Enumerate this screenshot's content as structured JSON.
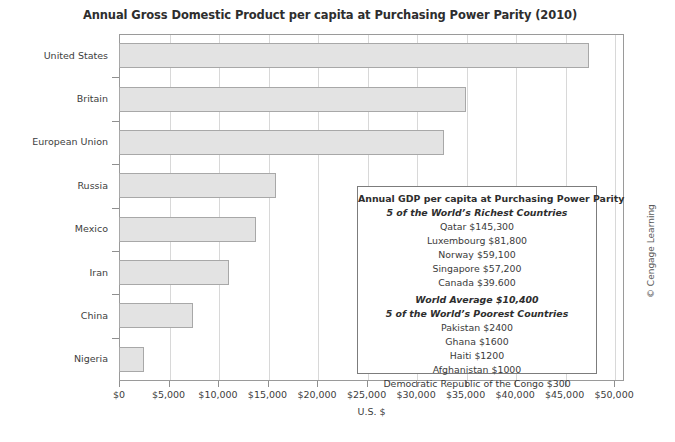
{
  "chart_data": {
    "type": "bar",
    "orientation": "horizontal",
    "title": "Annual Gross Domestic Product per capita at Purchasing Power Parity (2010)",
    "xlabel": "U.S. $",
    "ylabel": "",
    "categories": [
      "United States",
      "Britain",
      "European Union",
      "Russia",
      "Mexico",
      "Iran",
      "China",
      "Nigeria"
    ],
    "values": [
      47500,
      35000,
      32800,
      15900,
      13800,
      11100,
      7500,
      2500
    ],
    "xlim": [
      0,
      51000
    ],
    "xticks": [
      0,
      5000,
      10000,
      15000,
      20000,
      25000,
      30000,
      35000,
      40000,
      45000,
      50000
    ],
    "xticklabels": [
      "$0",
      "$5,000",
      "$10,000",
      "$15,000",
      "$20,000",
      "$25,000",
      "$30,000",
      "$35,000",
      "$40,000",
      "$45,000",
      "$50,000"
    ],
    "grid": "vertical",
    "legend": "none",
    "bar_fill": "#e3e3e3",
    "bar_border": "#a8a8a8",
    "grid_color": "#d8d8d8"
  },
  "infobox": {
    "heading": "Annual GDP per capita at Purchasing Power Parity",
    "richest_heading": "5 of the World’s Richest Countries",
    "richest": [
      "Qatar $145,300",
      "Luxembourg $81,800",
      "Norway $59,100",
      "Singapore $57,200",
      "Canada $39.600"
    ],
    "world_average": "World Average $10,400",
    "poorest_heading": "5 of the World’s Poorest Countries",
    "poorest": [
      "Pakistan $2400",
      "Ghana $1600",
      "Haiti $1200",
      "Afghanistan $1000",
      "Democratic Republic of the Congo $300"
    ]
  },
  "credit": "© Cengage Learning"
}
